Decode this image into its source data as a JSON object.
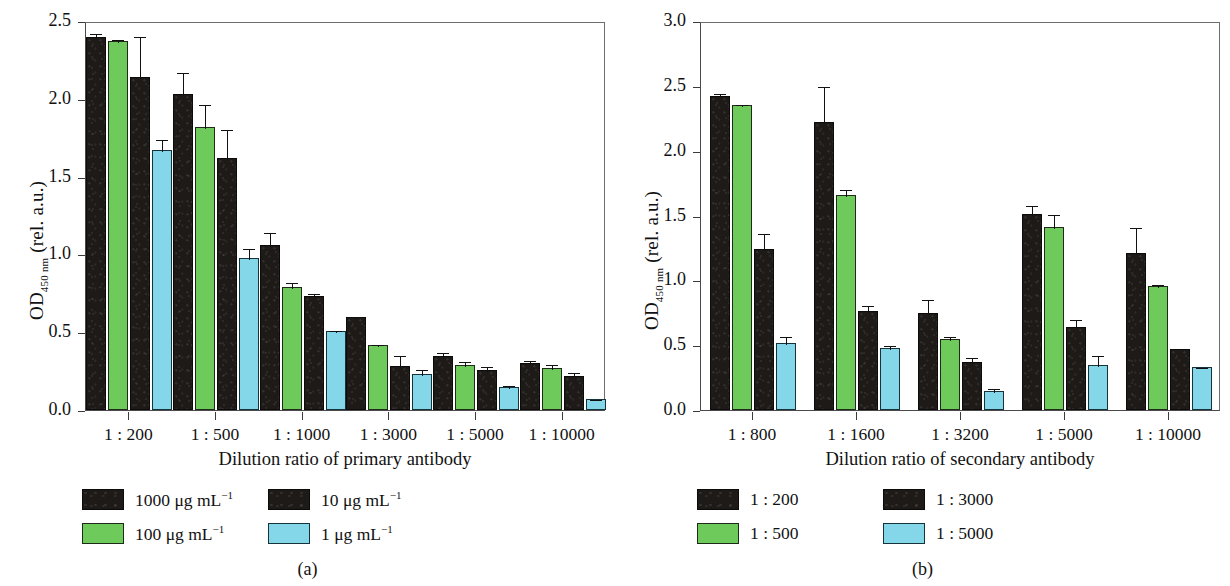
{
  "figure": {
    "panels": [
      {
        "caption": "(a)",
        "ylabel_main": "OD",
        "ylabel_sub": "450 nm",
        "ylabel_tail": " (rel. a.u.)",
        "xlabel": "Dilution ratio of primary antibody",
        "yticks": [
          "0.0",
          "0.5",
          "1.0",
          "1.5",
          "2.0",
          "2.5"
        ],
        "ylim": [
          0,
          2.5
        ],
        "categories": [
          "1 : 200",
          "1 : 500",
          "1 : 1000",
          "1 : 3000",
          "1 : 5000",
          "1 : 10000"
        ],
        "legend": [
          {
            "label": "1000 μg mL",
            "sup": "−1",
            "color": "#1d1a18",
            "key": "k1"
          },
          {
            "label": "100 μg mL",
            "sup": "−1",
            "color": "#6ECB5B",
            "key": "g"
          },
          {
            "label": "10 μg mL",
            "sup": "−1",
            "color": "#1d1a18",
            "key": "k2"
          },
          {
            "label": "1 μg mL",
            "sup": "−1",
            "color": "#84D7E8",
            "key": "c"
          }
        ]
      },
      {
        "caption": "(b)",
        "ylabel_main": "OD",
        "ylabel_sub": "450 nm",
        "ylabel_tail": " (rel. a.u.)",
        "xlabel": "Dilution ratio of secondary antibody",
        "yticks": [
          "0.0",
          "0.5",
          "1.0",
          "1.5",
          "2.0",
          "2.5",
          "3.0"
        ],
        "ylim": [
          0,
          3.0
        ],
        "categories": [
          "1 : 800",
          "1 : 1600",
          "1 : 3200",
          "1 : 5000",
          "1 : 10000"
        ],
        "legend": [
          {
            "label": "1 : 200",
            "sup": "",
            "color": "#1d1a18",
            "key": "k1"
          },
          {
            "label": "1 : 500",
            "sup": "",
            "color": "#6ECB5B",
            "key": "g"
          },
          {
            "label": "1 : 3000",
            "sup": "",
            "color": "#1d1a18",
            "key": "k2"
          },
          {
            "label": "1 : 5000",
            "sup": "",
            "color": "#84D7E8",
            "key": "c"
          }
        ]
      }
    ]
  },
  "chart_data": [
    {
      "type": "bar",
      "panel": "(a)",
      "title": "",
      "xlabel": "Dilution ratio of primary antibody",
      "ylabel": "OD450 nm (rel. a.u.)",
      "ylim": [
        0,
        2.5
      ],
      "yticks": [
        0.0,
        0.5,
        1.0,
        1.5,
        2.0,
        2.5
      ],
      "grid": false,
      "legend_position": "below-left",
      "categories": [
        "1 : 200",
        "1 : 500",
        "1 : 1000",
        "1 : 3000",
        "1 : 5000",
        "1 : 10000"
      ],
      "series": [
        {
          "name": "1000 μg mL−1",
          "color": "#1d1a18",
          "values": [
            2.4,
            2.03,
            1.06,
            0.6,
            0.35,
            0.3
          ],
          "errors": [
            0.03,
            0.15,
            0.09,
            0.01,
            0.03,
            0.03
          ]
        },
        {
          "name": "100 μg mL−1",
          "color": "#6ECB5B",
          "values": [
            2.37,
            1.82,
            0.79,
            0.42,
            0.29,
            0.27
          ],
          "errors": [
            0.02,
            0.15,
            0.04,
            0.01,
            0.03,
            0.03
          ]
        },
        {
          "name": "10 μg mL−1",
          "color": "#1d1a18",
          "values": [
            2.14,
            1.62,
            0.73,
            0.28,
            0.26,
            0.22
          ],
          "errors": [
            0.27,
            0.19,
            0.03,
            0.08,
            0.03,
            0.03
          ]
        },
        {
          "name": "1 μg mL−1",
          "color": "#84D7E8",
          "values": [
            1.67,
            0.98,
            0.51,
            0.23,
            0.15,
            0.07
          ],
          "errors": [
            0.08,
            0.07,
            0.01,
            0.04,
            0.02,
            0.01
          ]
        }
      ]
    },
    {
      "type": "bar",
      "panel": "(b)",
      "title": "",
      "xlabel": "Dilution ratio of secondary antibody",
      "ylabel": "OD450 nm (rel. a.u.)",
      "ylim": [
        0,
        3.0
      ],
      "yticks": [
        0.0,
        0.5,
        1.0,
        1.5,
        2.0,
        2.5,
        3.0
      ],
      "grid": false,
      "legend_position": "below-left",
      "categories": [
        "1 : 800",
        "1 : 1600",
        "1 : 3200",
        "1 : 5000",
        "1 : 10000"
      ],
      "series": [
        {
          "name": "1 : 200",
          "color": "#1d1a18",
          "values": [
            2.42,
            2.22,
            0.75,
            1.51,
            1.21
          ],
          "errors": [
            0.03,
            0.29,
            0.11,
            0.08,
            0.21
          ]
        },
        {
          "name": "1 : 500",
          "color": "#6ECB5B",
          "values": [
            2.35,
            1.66,
            0.55,
            1.41,
            0.96
          ],
          "errors": [
            0.02,
            0.05,
            0.03,
            0.11,
            0.02
          ]
        },
        {
          "name": "1 : 3000",
          "color": "#1d1a18",
          "values": [
            1.24,
            0.76,
            0.37,
            0.64,
            0.47
          ],
          "errors": [
            0.13,
            0.06,
            0.05,
            0.07,
            0.0
          ]
        },
        {
          "name": "1 : 5000",
          "color": "#84D7E8",
          "values": [
            0.52,
            0.48,
            0.15,
            0.35,
            0.33
          ],
          "errors": [
            0.06,
            0.03,
            0.03,
            0.08,
            0.01
          ]
        }
      ]
    }
  ]
}
